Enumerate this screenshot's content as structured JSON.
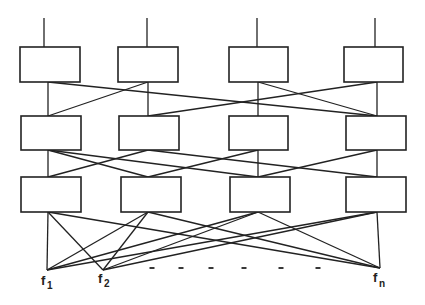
{
  "diagram": {
    "type": "multistage-network",
    "colors": {
      "stroke": "#222222",
      "background": "#ffffff"
    },
    "stages": 3,
    "boxes_per_stage": 4,
    "columns_x": [
      48,
      148,
      258,
      377
    ],
    "rows": [
      {
        "y": 47,
        "h": 35,
        "boxes": [
          [
            20,
            60
          ],
          [
            118,
            60
          ],
          [
            229,
            59
          ],
          [
            344,
            59
          ]
        ]
      },
      {
        "y": 116,
        "h": 34,
        "boxes": [
          [
            21,
            60
          ],
          [
            119,
            60
          ],
          [
            229,
            59
          ],
          [
            346,
            60
          ]
        ]
      },
      {
        "y": 177,
        "h": 35,
        "boxes": [
          [
            21,
            60
          ],
          [
            121,
            60
          ],
          [
            230,
            60
          ],
          [
            346,
            60
          ]
        ]
      }
    ],
    "inputs": {
      "stem_top": 18,
      "xs": [
        44,
        147,
        257,
        375
      ]
    },
    "stage1_to_2": [
      [
        0,
        0
      ],
      [
        0,
        3
      ],
      [
        1,
        1
      ],
      [
        1,
        0
      ],
      [
        2,
        2
      ],
      [
        2,
        3
      ],
      [
        3,
        3
      ],
      [
        3,
        1
      ]
    ],
    "stage2_to_3": [
      [
        0,
        0
      ],
      [
        0,
        1
      ],
      [
        0,
        2
      ],
      [
        1,
        0
      ],
      [
        1,
        3
      ],
      [
        2,
        1
      ],
      [
        2,
        2
      ],
      [
        3,
        2
      ],
      [
        3,
        3
      ]
    ],
    "outputs": [
      {
        "id": "f1",
        "base": "f",
        "sub": "1",
        "x": 47,
        "y": 270
      },
      {
        "id": "f2",
        "base": "f",
        "sub": "2",
        "x": 103,
        "y": 270
      },
      {
        "id": "fn",
        "base": "f",
        "sub": "n",
        "x": 380,
        "y": 268
      }
    ],
    "ellipsis_dashes_x": [
      152,
      181,
      211,
      244,
      281,
      318
    ],
    "ellipsis_y": 268
  },
  "labels": {
    "f1_base": "f",
    "f1_sub": "1",
    "f2_base": "f",
    "f2_sub": "2",
    "fn_base": "f",
    "fn_sub": "n"
  }
}
